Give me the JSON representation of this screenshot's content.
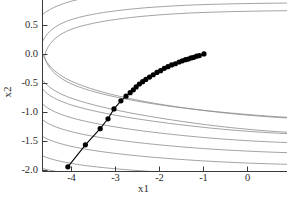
{
  "chart_data": {
    "type": "line",
    "title": "",
    "subtitle": "",
    "xlabel": "x1",
    "ylabel": "x2",
    "xlim": [
      -4.55,
      0.75
    ],
    "ylim": [
      -2.08,
      0.88
    ],
    "xticks": [
      -4,
      -3,
      -2,
      -1,
      0
    ],
    "xticklabels": [
      "-4",
      "-3",
      "-2",
      "-1",
      "0"
    ],
    "yticks": [
      0.5,
      0.0,
      -0.5,
      -1.0,
      -1.5,
      -2.0
    ],
    "yticklabels": [
      "0.5",
      "0.0",
      "-0.5",
      "-1.0",
      "-1.5",
      "-2.0"
    ],
    "grid": false,
    "legend": null,
    "annotations": [],
    "series": [
      {
        "name": "optimization-trajectory",
        "type": "line+markers",
        "marker": "filled-circle",
        "marker_color": "#000000",
        "line_color": "#000000",
        "x": [
          -4.0,
          -3.62,
          -3.3,
          -3.13,
          -3.0,
          -2.85,
          -2.74,
          -2.65,
          -2.58,
          -2.52,
          -2.45,
          -2.38,
          -2.31,
          -2.23,
          -2.15,
          -2.07,
          -1.99,
          -1.91,
          -1.83,
          -1.75,
          -1.67,
          -1.59,
          -1.52,
          -1.45,
          -1.39,
          -1.33,
          -1.27,
          -1.21,
          -1.15,
          -1.05
        ],
        "y": [
          -2.0,
          -1.62,
          -1.34,
          -1.17,
          -1.0,
          -0.86,
          -0.78,
          -0.72,
          -0.67,
          -0.62,
          -0.57,
          -0.53,
          -0.49,
          -0.45,
          -0.41,
          -0.37,
          -0.34,
          -0.3,
          -0.27,
          -0.24,
          -0.22,
          -0.19,
          -0.17,
          -0.15,
          -0.14,
          -0.12,
          -0.11,
          -0.09,
          -0.08,
          -0.05
        ]
      }
    ],
    "contours": {
      "name": "objective-contours",
      "color": "#7a7a7a",
      "count": 11,
      "description": "nested banana-shaped level sets of a Rosenbrock-type objective opening to the right"
    }
  },
  "axes": {
    "x_title": "x1",
    "y_title": "x2"
  }
}
